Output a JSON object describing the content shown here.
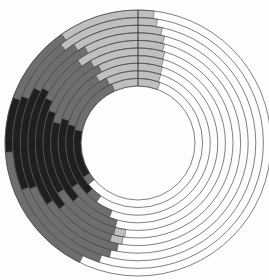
{
  "figure": {
    "width": 269,
    "height": 280,
    "cx": 138,
    "cy": 143,
    "inner_radius": 57,
    "outer_radius": 133,
    "ring_count": 10,
    "background": "#fdfdfd",
    "ring_outline_color": "#4a4a4a",
    "ring_outline_width": 0.7,
    "segment_edge_width": 0.5,
    "seam_color": "#333333",
    "seam_width": 1
  },
  "chart_data": {
    "type": "radial-ring-heatmap",
    "title": "",
    "angle_convention": "degrees clockwise from 12 o'clock; end values > 360 wrap past the top seam",
    "ring_order": "ring 1 = outermost, ring 10 = innermost",
    "empty_style": "white ring outlines only",
    "colors": {
      "light": "#bfbfbf",
      "medium": "#6e6e6e",
      "dark": "#1f1f1f"
    },
    "rings": [
      {
        "ring": 1,
        "segments": [
          {
            "s": 206,
            "e": 266,
            "c": "medium"
          },
          {
            "s": 266,
            "e": 290,
            "c": "dark"
          },
          {
            "s": 290,
            "e": 325,
            "c": "medium"
          },
          {
            "s": 325,
            "e": 367,
            "c": "light"
          }
        ]
      },
      {
        "ring": 2,
        "segments": [
          {
            "s": 198,
            "e": 248,
            "c": "medium"
          },
          {
            "s": 248,
            "e": 292,
            "c": "dark"
          },
          {
            "s": 292,
            "e": 322,
            "c": "medium"
          },
          {
            "s": 322,
            "e": 369,
            "c": "light"
          }
        ]
      },
      {
        "ring": 3,
        "segments": [
          {
            "s": 194,
            "e": 247,
            "c": "medium"
          },
          {
            "s": 247,
            "e": 298,
            "c": "dark"
          },
          {
            "s": 298,
            "e": 327,
            "c": "medium"
          },
          {
            "s": 327,
            "e": 372,
            "c": "light"
          }
        ]
      },
      {
        "ring": 4,
        "segments": [
          {
            "s": 191,
            "e": 236,
            "c": "medium"
          },
          {
            "s": 236,
            "e": 300,
            "c": "dark"
          },
          {
            "s": 300,
            "e": 331,
            "c": "medium"
          },
          {
            "s": 331,
            "e": 374,
            "c": "light"
          }
        ]
      },
      {
        "ring": 5,
        "segments": [
          {
            "s": 189,
            "e": 196,
            "c": "light"
          },
          {
            "s": 196,
            "e": 230,
            "c": "medium"
          },
          {
            "s": 230,
            "e": 296,
            "c": "dark"
          },
          {
            "s": 296,
            "e": 324,
            "c": "medium"
          },
          {
            "s": 324,
            "e": 375,
            "c": "light"
          }
        ]
      },
      {
        "ring": 6,
        "segments": [
          {
            "s": 188,
            "e": 195,
            "c": "light"
          },
          {
            "s": 195,
            "e": 238,
            "c": "medium"
          },
          {
            "s": 238,
            "e": 290,
            "c": "dark"
          },
          {
            "s": 290,
            "e": 330,
            "c": "medium"
          },
          {
            "s": 330,
            "e": 376.5,
            "c": "light"
          }
        ]
      },
      {
        "ring": 7,
        "segments": [
          {
            "s": 195,
            "e": 228,
            "c": "medium"
          },
          {
            "s": 228,
            "e": 284,
            "c": "dark"
          },
          {
            "s": 284,
            "e": 333,
            "c": "medium"
          },
          {
            "s": 333,
            "e": 377,
            "c": "light"
          }
        ]
      },
      {
        "ring": 8,
        "segments": [
          {
            "s": 201,
            "e": 236,
            "c": "medium"
          },
          {
            "s": 236,
            "e": 288,
            "c": "dark"
          },
          {
            "s": 288,
            "e": 328,
            "c": "medium"
          },
          {
            "s": 328,
            "e": 378,
            "c": "light"
          }
        ]
      },
      {
        "ring": 9,
        "segments": [
          {
            "s": 215,
            "e": 225,
            "c": "medium"
          },
          {
            "s": 225,
            "e": 285,
            "c": "dark"
          },
          {
            "s": 285,
            "e": 334,
            "c": "medium"
          },
          {
            "s": 334,
            "e": 378.5,
            "c": "light"
          }
        ]
      },
      {
        "ring": 10,
        "segments": [
          {
            "s": 230,
            "e": 238,
            "c": "medium"
          },
          {
            "s": 238,
            "e": 282,
            "c": "dark"
          },
          {
            "s": 282,
            "e": 336,
            "c": "medium"
          },
          {
            "s": 336,
            "e": 380,
            "c": "light"
          }
        ]
      }
    ]
  }
}
